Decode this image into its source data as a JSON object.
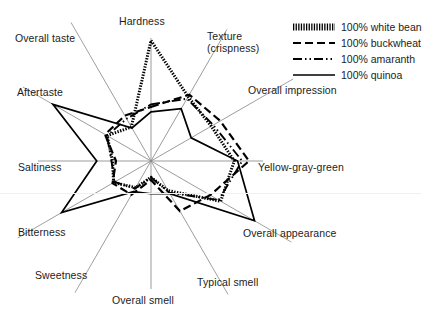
{
  "figure": {
    "background_color": "#ffffff",
    "axis_line_color": "#8a8a8a",
    "series_color": "#000000"
  },
  "legend": {
    "position": "top-right",
    "items": [
      {
        "label": "100% white bean",
        "style": "hatched",
        "key_name": "legend-key-white-bean"
      },
      {
        "label": "100% buckwheat",
        "style": "dashed",
        "key_name": "legend-key-buckwheat"
      },
      {
        "label": "100% amaranth",
        "style": "dash-dot-dot",
        "key_name": "legend-key-amaranth"
      },
      {
        "label": "100% quinoa",
        "style": "solid",
        "key_name": "legend-key-quinoa"
      }
    ]
  },
  "chart_data": {
    "type": "radar",
    "title": "",
    "subtitle": "",
    "xlabel": "",
    "ylabel": "",
    "grid": false,
    "legend_position": "top-right",
    "axis_count": 12,
    "rlim": [
      0,
      10
    ],
    "categories": [
      "Hardness",
      "Texture (crispness)",
      "Overall impression",
      "Yellow-gray-green",
      "Overall appearance",
      "Typical smell",
      "Overall smell",
      "Sweetness",
      "Bitterness",
      "Saltiness",
      "Aftertaste",
      "Overall taste"
    ],
    "category_lines": [
      [
        "Hardness"
      ],
      [
        "Texture",
        "(crispness)"
      ],
      [
        "Overall impression"
      ],
      [
        "Yellow-gray-green"
      ],
      [
        "Overall appearance"
      ],
      [
        "Typical smell"
      ],
      [
        "Overall smell"
      ],
      [
        "Sweetness"
      ],
      [
        "Bitterness"
      ],
      [
        "Saltiness"
      ],
      [
        "Aftertaste"
      ],
      [
        "Overall taste"
      ]
    ],
    "series": [
      {
        "name": "100% white bean",
        "style": "hatched",
        "values": [
          9.8,
          6.4,
          6.0,
          7.3,
          6.6,
          2.9,
          1.3,
          2.6,
          3.6,
          3.4,
          4.3,
          3.3
        ]
      },
      {
        "name": "100% buckwheat",
        "style": "dashed",
        "values": [
          4.4,
          6.6,
          6.9,
          8.6,
          5.6,
          4.9,
          1.5,
          3.3,
          3.7,
          3.1,
          4.5,
          4.4
        ]
      },
      {
        "name": "100% amaranth",
        "style": "dash-dot-dot",
        "values": [
          4.6,
          6.2,
          6.2,
          8.0,
          6.4,
          3.1,
          1.3,
          2.7,
          3.5,
          3.5,
          4.3,
          4.1
        ]
      },
      {
        "name": "100% quinoa",
        "style": "solid",
        "values": [
          4.0,
          5.2,
          4.0,
          7.6,
          9.8,
          3.2,
          2.6,
          3.0,
          8.6,
          4.8,
          9.6,
          3.2
        ]
      }
    ]
  },
  "axis_label_positions": [
    {
      "name": "label-hardness",
      "left": 119,
      "top": 16
    },
    {
      "name": "label-texture-crispness",
      "left": 207,
      "top": 31
    },
    {
      "name": "label-overall-impression",
      "left": 248,
      "top": 85
    },
    {
      "name": "label-yellow-gray-green",
      "left": 258,
      "top": 162
    },
    {
      "name": "label-overall-appearance",
      "left": 243,
      "top": 228
    },
    {
      "name": "label-typical-smell",
      "left": 197,
      "top": 277
    },
    {
      "name": "label-overall-smell",
      "left": 112,
      "top": 295
    },
    {
      "name": "label-sweetness",
      "left": 35,
      "top": 270
    },
    {
      "name": "label-bitterness",
      "left": 18,
      "top": 227
    },
    {
      "name": "label-saltiness",
      "left": 18,
      "top": 162
    },
    {
      "name": "label-aftertaste",
      "left": 17,
      "top": 87
    },
    {
      "name": "label-overall-taste",
      "left": 15,
      "top": 33
    }
  ]
}
